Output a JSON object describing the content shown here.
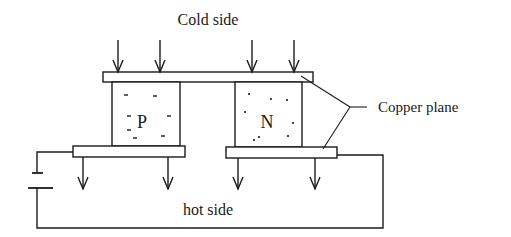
{
  "diagram": {
    "labels": {
      "cold_side": "Cold side",
      "hot_side": "hot side",
      "copper_plane": "Copper plane",
      "p_type": "P",
      "n_type": "N"
    },
    "colors": {
      "stroke": "#1a1a1a",
      "background": "#ffffff"
    },
    "arrows": {
      "cold_side_count": 4,
      "hot_side_count": 4,
      "direction": "down"
    },
    "components": [
      "top copper plate",
      "P-type semiconductor block",
      "N-type semiconductor block",
      "bottom-left copper plate",
      "bottom-right copper plate",
      "DC battery",
      "circuit wire"
    ]
  }
}
